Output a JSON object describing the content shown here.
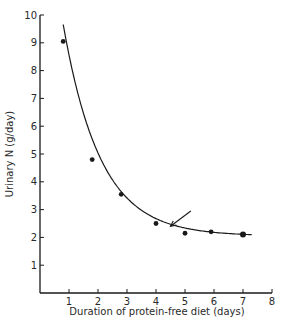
{
  "chart_data": {
    "type": "line",
    "title": "",
    "xlabel": "Duration of protein-free diet  (days)",
    "ylabel": "Urinary N  (g/day)",
    "xlim": [
      0,
      8
    ],
    "ylim": [
      0,
      10
    ],
    "x_ticks": [
      1,
      2,
      3,
      4,
      5,
      6,
      7,
      8
    ],
    "y_ticks": [
      1,
      2,
      3,
      4,
      5,
      6,
      7,
      8,
      9,
      10
    ],
    "grid": false,
    "legend": null,
    "series": [
      {
        "name": "Urinary N",
        "style": "points with fitted exponential decay curve",
        "x": [
          0.8,
          1.8,
          2.8,
          4.0,
          5.0,
          5.9,
          7.0
        ],
        "y": [
          9.05,
          4.8,
          3.55,
          2.5,
          2.15,
          2.2,
          2.1
        ]
      }
    ],
    "annotations": [
      {
        "type": "arrow",
        "from": [
          5.2,
          2.95
        ],
        "to": [
          4.5,
          2.4
        ],
        "note": "arrow pointing to curve near plateau"
      }
    ]
  },
  "colors": {
    "ink": "#1a1a1a",
    "background": "#ffffff"
  }
}
